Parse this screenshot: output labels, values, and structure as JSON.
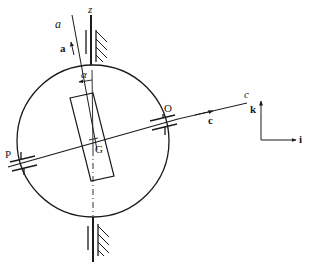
{
  "figure": {
    "labels": {
      "axis_a": "a",
      "vector_a": "a",
      "axis_z": "z",
      "angle": "α",
      "point_O": "O",
      "point_P": "P",
      "point_G": "G",
      "axis_c": "c",
      "vector_c": "c",
      "vector_k": "k",
      "vector_i": "i"
    },
    "colors": {
      "ink": "#1a1a1a",
      "background": "#ffffff"
    }
  }
}
